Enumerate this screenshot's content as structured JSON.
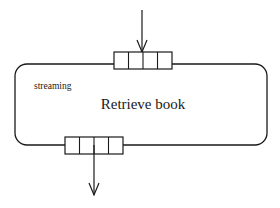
{
  "diagram": {
    "type": "activity-node-with-pins",
    "action": {
      "name": "Retrieve book",
      "stereotype": "streaming"
    },
    "input_pin": {
      "position": "top",
      "slots": 4,
      "arrow": "incoming"
    },
    "output_pin": {
      "position": "bottom",
      "slots": 4,
      "arrow": "outgoing"
    },
    "colors": {
      "stroke": "#1a1a1a",
      "background": "#ffffff"
    }
  }
}
